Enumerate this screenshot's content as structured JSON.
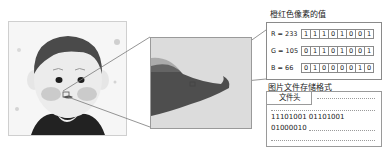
{
  "figure": {
    "pixel_panel": {
      "title": "橙红色像素的值",
      "rows": [
        {
          "label": "R = 233",
          "bits": [
            "1",
            "1",
            "1",
            "0",
            "1",
            "0",
            "0",
            "1"
          ]
        },
        {
          "label": "G = 105",
          "bits": [
            "0",
            "1",
            "1",
            "0",
            "1",
            "0",
            "0",
            "1"
          ]
        },
        {
          "label": "B = 66",
          "bits": [
            "0",
            "1",
            "0",
            "0",
            "0",
            "0",
            "1",
            "0"
          ]
        }
      ]
    },
    "file_panel": {
      "title": "图片文件存储格式",
      "header_label": "文件头",
      "line1": "11101001   01101001",
      "line2": "01000010"
    },
    "colors": {
      "border": "#8a8a8a",
      "pixel_highlight": "#e9693f"
    }
  }
}
